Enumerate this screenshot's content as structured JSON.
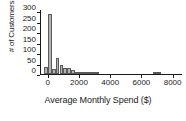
{
  "chart_data": {
    "type": "bar",
    "title": "",
    "subtitle": "",
    "xlabel": "Average Monthly Spend ($)",
    "ylabel": "# of Customers",
    "xlim": [
      -500,
      8600
    ],
    "ylim": [
      0,
      310
    ],
    "grid": false,
    "legend": null,
    "xticks": [
      0,
      2000,
      4000,
      6000,
      8000
    ],
    "xtick_labels": [
      "0",
      "2000",
      "4000",
      "6000",
      "8000"
    ],
    "yticks": [
      0,
      50,
      100,
      150,
      200,
      250,
      300
    ],
    "ytick_labels": [
      "0",
      "50",
      "100",
      "150",
      "200",
      "250",
      "300"
    ],
    "bin_width": 250,
    "bins": [
      {
        "x0": -250,
        "x1": 0,
        "value": 36
      },
      {
        "x0": 0,
        "x1": 250,
        "value": 290
      },
      {
        "x0": 250,
        "x1": 500,
        "value": 22
      },
      {
        "x0": 500,
        "x1": 750,
        "value": 76
      },
      {
        "x0": 750,
        "x1": 1000,
        "value": 44
      },
      {
        "x0": 1000,
        "x1": 1250,
        "value": 30
      },
      {
        "x0": 1250,
        "x1": 1500,
        "value": 29
      },
      {
        "x0": 1500,
        "x1": 1750,
        "value": 18
      },
      {
        "x0": 1750,
        "x1": 2000,
        "value": 11
      },
      {
        "x0": 2000,
        "x1": 2250,
        "value": 4
      },
      {
        "x0": 2250,
        "x1": 2500,
        "value": 3
      },
      {
        "x0": 2500,
        "x1": 2750,
        "value": 2
      },
      {
        "x0": 2750,
        "x1": 3000,
        "value": 2
      },
      {
        "x0": 3000,
        "x1": 3250,
        "value": 1
      },
      {
        "x0": 6750,
        "x1": 7250,
        "value": 3
      }
    ],
    "categories": [
      "-250",
      "0",
      "250",
      "500",
      "750",
      "1000",
      "1250",
      "1500",
      "1750",
      "2000",
      "2250",
      "2500",
      "2750",
      "3000",
      "6750"
    ],
    "values": [
      36,
      290,
      22,
      76,
      44,
      30,
      29,
      18,
      11,
      4,
      3,
      2,
      2,
      1,
      3
    ],
    "colors": {
      "bar_fill": "#b4b4b4",
      "bar_edge": "#5a5a5a",
      "axis": "#1a1a1a",
      "text": "#1a1a1a",
      "background": "#ffffff"
    }
  }
}
